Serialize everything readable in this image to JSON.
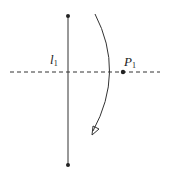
{
  "diagram": {
    "line_label": "l",
    "line_label_sub": "1",
    "point_label": "P",
    "point_label_sub": "1",
    "colors": {
      "stroke": "#333333",
      "background": "#ffffff"
    },
    "elements": {
      "vertical_line": {
        "x": 68,
        "y1": 16,
        "y2": 165
      },
      "horizontal_dashed_axis": {
        "y": 72,
        "x1": 10,
        "x2": 160
      },
      "point_P1": {
        "x": 123,
        "y": 72
      },
      "rotation_arc": {
        "start": [
          95,
          14
        ],
        "end": [
          92,
          134
        ],
        "direction": "clockwise-down"
      }
    }
  }
}
